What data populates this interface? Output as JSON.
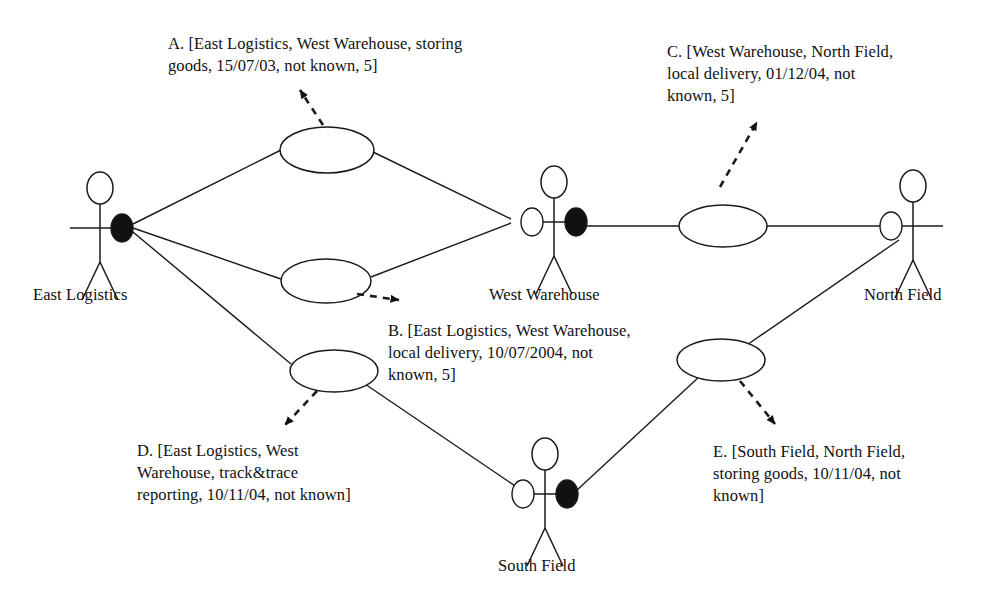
{
  "diagram": {
    "type": "uml-use-case-diagram",
    "stroke_color": "#1a1a1a",
    "fill_initiator": "#111111",
    "fill_usecase": "#ffffff",
    "actors": [
      {
        "id": "east-logistics",
        "label": "East Logistics",
        "x": 100,
        "y": 228,
        "label_x": 33,
        "label_y": 285,
        "left_marker": "none",
        "right_marker": "filled"
      },
      {
        "id": "west-warehouse",
        "label": "West Warehouse",
        "x": 554,
        "y": 222,
        "label_x": 489,
        "label_y": 285,
        "left_marker": "hollow",
        "right_marker": "filled"
      },
      {
        "id": "north-field",
        "label": "North Field",
        "x": 913,
        "y": 226,
        "label_x": 864,
        "label_y": 285,
        "left_marker": "hollow",
        "right_marker": "none"
      },
      {
        "id": "south-field",
        "label": "South Field",
        "x": 545,
        "y": 494,
        "label_x": 498,
        "label_y": 556,
        "left_marker": "hollow",
        "right_marker": "filled"
      }
    ],
    "use_cases": [
      {
        "id": "uc-a",
        "cx": 327,
        "cy": 150,
        "rx": 47,
        "ry": 23
      },
      {
        "id": "uc-b",
        "cx": 326,
        "cy": 281,
        "rx": 45,
        "ry": 22
      },
      {
        "id": "uc-c",
        "cx": 723,
        "cy": 226,
        "rx": 44,
        "ry": 21
      },
      {
        "id": "uc-d",
        "cx": 334,
        "cy": 371,
        "rx": 44,
        "ry": 21
      },
      {
        "id": "uc-e",
        "cx": 721,
        "cy": 360,
        "rx": 44,
        "ry": 21
      }
    ],
    "associations": [
      {
        "from": "east-logistics",
        "to": "uc-a",
        "x1": 133,
        "y1": 224,
        "x2": 281,
        "y2": 150
      },
      {
        "from": "uc-a",
        "to": "west-warehouse",
        "x1": 373,
        "y1": 152,
        "x2": 511,
        "y2": 219
      },
      {
        "from": "east-logistics",
        "to": "uc-b",
        "x1": 133,
        "y1": 228,
        "x2": 281,
        "y2": 279
      },
      {
        "from": "uc-b",
        "to": "west-warehouse",
        "x1": 371,
        "y1": 277,
        "x2": 511,
        "y2": 223
      },
      {
        "from": "east-logistics",
        "to": "uc-d",
        "x1": 133,
        "y1": 232,
        "x2": 291,
        "y2": 364
      },
      {
        "from": "uc-d",
        "to": "south-field",
        "x1": 362,
        "y1": 382,
        "x2": 524,
        "y2": 492
      },
      {
        "from": "west-warehouse",
        "to": "uc-c",
        "x1": 586,
        "y1": 226,
        "x2": 679,
        "y2": 226
      },
      {
        "from": "uc-c",
        "to": "north-field",
        "x1": 767,
        "y1": 226,
        "x2": 896,
        "y2": 226
      },
      {
        "from": "south-field",
        "to": "uc-e",
        "x1": 576,
        "y1": 491,
        "x2": 700,
        "y2": 376
      },
      {
        "from": "uc-e",
        "to": "north-field",
        "x1": 744,
        "y1": 347,
        "x2": 899,
        "y2": 240
      }
    ],
    "annotation_links": [
      {
        "id": "link-a",
        "from": "uc-a",
        "x1": 323,
        "y1": 125,
        "x2": 300,
        "y2": 90,
        "direction": "up-left"
      },
      {
        "id": "link-b",
        "from": "uc-b",
        "x1": 357,
        "y1": 294,
        "x2": 399,
        "y2": 300,
        "direction": "down-right"
      },
      {
        "id": "link-c",
        "from": "uc-c",
        "x1": 720,
        "y1": 187,
        "x2": 757,
        "y2": 122,
        "direction": "up-right"
      },
      {
        "id": "link-d",
        "from": "uc-d",
        "x1": 317,
        "y1": 391,
        "x2": 285,
        "y2": 425,
        "direction": "down-left"
      },
      {
        "id": "link-e",
        "from": "uc-e",
        "x1": 740,
        "y1": 381,
        "x2": 775,
        "y2": 424,
        "direction": "down-right"
      }
    ],
    "notes": [
      {
        "id": "note-a",
        "key": "A",
        "text": "A. [East Logistics, West Warehouse, storing\ngoods, 15/07/03, not known, 5]",
        "x": 168,
        "y": 33,
        "width": 420
      },
      {
        "id": "note-c",
        "key": "C",
        "text": "C. [West Warehouse, North Field,\nlocal delivery, 01/12/04, not\nknown, 5]",
        "x": 667,
        "y": 41,
        "width": 280
      },
      {
        "id": "note-b",
        "key": "B",
        "text": "B. [East Logistics, West Warehouse,\nlocal delivery, 10/07/2004, not\nknown, 5]",
        "x": 388,
        "y": 320,
        "width": 300
      },
      {
        "id": "note-d",
        "key": "D",
        "text": "D. [East Logistics, West\nWarehouse, track&trace\nreporting, 10/11/04, not known]",
        "x": 137,
        "y": 440,
        "width": 290
      },
      {
        "id": "note-e",
        "key": "E",
        "text": "E. [South Field, North Field,\nstoring goods, 10/11/04, not\nknown]",
        "x": 713,
        "y": 441,
        "width": 270
      }
    ]
  }
}
